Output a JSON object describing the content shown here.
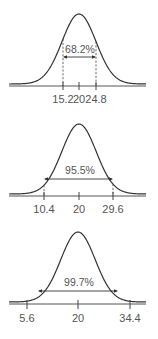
{
  "chart_data": [
    {
      "type": "area",
      "title": "",
      "mean": 20,
      "interval": [
        15.2,
        24.8
      ],
      "label": "68.2%",
      "tick_labels": [
        "15.2",
        "20",
        "24.8"
      ],
      "sigma_multiple": 1
    },
    {
      "type": "area",
      "title": "",
      "mean": 20,
      "interval": [
        10.4,
        29.6
      ],
      "label": "95.5%",
      "tick_labels": [
        "10.4",
        "20",
        "29.6"
      ],
      "sigma_multiple": 2
    },
    {
      "type": "area",
      "title": "",
      "mean": 20,
      "interval": [
        5.6,
        34.4
      ],
      "label": "99.7%",
      "tick_labels": [
        "5.6",
        "20",
        "34.4"
      ],
      "sigma_multiple": 3
    }
  ],
  "panels": [
    {
      "baseline_y": 86,
      "peak_y": 14,
      "center_x": 79,
      "sigma_px": 17,
      "tick_x": [
        63,
        79,
        96
      ],
      "arrow_y": 57,
      "pct_y": 54,
      "label_y": 103,
      "dashed": true,
      "tick_len_up": 4,
      "tick_len_down": 4,
      "label": "68.2%",
      "tick_labels": [
        "15.2",
        "20",
        "24.8"
      ]
    },
    {
      "baseline_y": 196,
      "peak_y": 124,
      "center_x": 79,
      "sigma_px": 17.2,
      "tick_x": [
        44,
        79,
        113
      ],
      "arrow_y": 179,
      "pct_y": 175,
      "label_y": 213,
      "dashed": true,
      "tick_len_up": 4,
      "tick_len_down": 4,
      "label": "95.5%",
      "tick_labels": [
        "10.4",
        "20",
        "29.6"
      ]
    },
    {
      "baseline_y": 304,
      "peak_y": 232,
      "center_x": 78,
      "sigma_px": 17.2,
      "tick_x": [
        27,
        78,
        130
      ],
      "arrow_y": 291,
      "pct_y": 287,
      "label_y": 322,
      "dashed": false,
      "tick_len_up": 4,
      "tick_len_down": 5,
      "label": "99.7%",
      "tick_labels": [
        "5.6",
        "20",
        "34.4"
      ]
    }
  ],
  "axis": {
    "x_start": 9,
    "x_end": 146
  },
  "colors": {
    "curve": "#333333",
    "text": "#555555",
    "background": "#ffffff"
  }
}
